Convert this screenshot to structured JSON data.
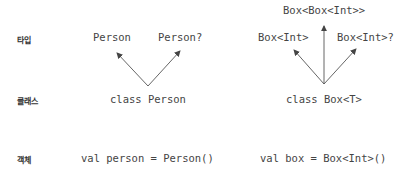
{
  "row_labels": {
    "type": "타입",
    "class": "클래스",
    "object": "객체"
  },
  "left": {
    "types": [
      "Person",
      "Person?"
    ],
    "class": "class Person",
    "object": "val person = Person()"
  },
  "right": {
    "top_type": "Box<Box<Int>>",
    "types": [
      "Box<Int>",
      "Box<Int>?"
    ],
    "class": "class Box<T>",
    "object": "val box = Box<Int>()"
  },
  "colors": {
    "text": "#444444",
    "arrow": "#555555"
  }
}
